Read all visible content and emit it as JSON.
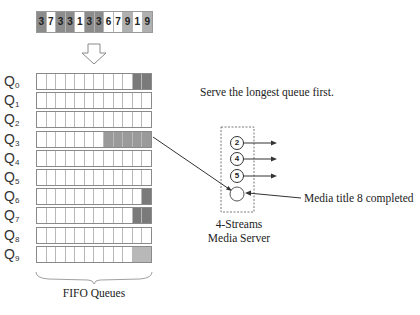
{
  "diagram": {
    "request_sequence": {
      "items": [
        {
          "value": "3",
          "fill": "#8c8c8c"
        },
        {
          "value": "7",
          "fill": "#ffffff"
        },
        {
          "value": "3",
          "fill": "#8c8c8c"
        },
        {
          "value": "3",
          "fill": "#8c8c8c"
        },
        {
          "value": "1",
          "fill": "#ffffff"
        },
        {
          "value": "3",
          "fill": "#8c8c8c"
        },
        {
          "value": "3",
          "fill": "#8c8c8c"
        },
        {
          "value": "6",
          "fill": "#ffffff"
        },
        {
          "value": "7",
          "fill": "#ffffff"
        },
        {
          "value": "9",
          "fill": "#b0b0b0"
        },
        {
          "value": "1",
          "fill": "#ffffff"
        },
        {
          "value": "9",
          "fill": "#b0b0b0"
        }
      ]
    },
    "queues": {
      "cells_per_queue": 12,
      "rows": [
        {
          "label": "Q",
          "sub": "0",
          "filled": 2,
          "fill": "#7a7a7a"
        },
        {
          "label": "Q",
          "sub": "1",
          "filled": 0,
          "fill": "#ffffff"
        },
        {
          "label": "Q",
          "sub": "2",
          "filled": 0,
          "fill": "#ffffff"
        },
        {
          "label": "Q",
          "sub": "3",
          "filled": 5,
          "fill": "#9a9a9a"
        },
        {
          "label": "Q",
          "sub": "4",
          "filled": 0,
          "fill": "#ffffff"
        },
        {
          "label": "Q",
          "sub": "5",
          "filled": 0,
          "fill": "#ffffff"
        },
        {
          "label": "Q",
          "sub": "6",
          "filled": 1,
          "fill": "#7a7a7a"
        },
        {
          "label": "Q",
          "sub": "7",
          "filled": 2,
          "fill": "#7a7a7a"
        },
        {
          "label": "Q",
          "sub": "8",
          "filled": 0,
          "fill": "#ffffff"
        },
        {
          "label": "Q",
          "sub": "9",
          "filled": 2,
          "fill": "#b8b8b8"
        }
      ],
      "caption": "FIFO Queues"
    },
    "policy_text": "Serve the longest queue first.",
    "server": {
      "streams": [
        "2",
        "4",
        "5"
      ],
      "caption_line1": "4-Streams",
      "caption_line2": "Media Server"
    },
    "completion_label": "Media title 8 completed"
  }
}
